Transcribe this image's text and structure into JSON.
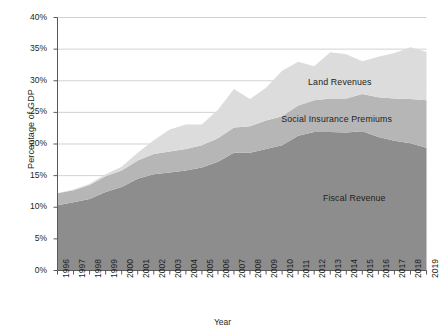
{
  "chart_data": {
    "type": "area",
    "stacked": true,
    "title": "",
    "subtitle": "",
    "xlabel": "Year",
    "ylabel": "Percentage of GDP",
    "grid": true,
    "legend_position": "inline-labels",
    "xlim": [
      1996,
      2019
    ],
    "ylim": [
      0,
      40
    ],
    "ytick_labels": [
      "0%",
      "5%",
      "10%",
      "15%",
      "20%",
      "25%",
      "30%",
      "35%",
      "40%"
    ],
    "ytick_values": [
      0,
      5,
      10,
      15,
      20,
      25,
      30,
      35,
      40
    ],
    "categories": [
      "1996",
      "1997",
      "1998",
      "1999",
      "2000",
      "2001",
      "2002",
      "2003",
      "2004",
      "2005",
      "2006",
      "2007",
      "2008",
      "2009",
      "2010",
      "2011",
      "2012",
      "2013",
      "2014",
      "2015",
      "2016",
      "2017",
      "2018",
      "2019"
    ],
    "series": [
      {
        "name": "Fiscal Revenue",
        "color": "#8d8d8d",
        "label_x": 2014.5,
        "label_y": 11.5,
        "values": [
          10.3,
          10.8,
          11.3,
          12.4,
          13.2,
          14.5,
          15.2,
          15.5,
          15.8,
          16.3,
          17.2,
          18.6,
          18.6,
          19.2,
          19.8,
          21.3,
          21.9,
          21.9,
          21.8,
          22.0,
          21.1,
          20.5,
          20.1,
          19.4
        ]
      },
      {
        "name": "Social Insurance Premiums",
        "color": "#b6b6b6",
        "label_x": 2013.4,
        "label_y": 24.0,
        "values": [
          1.9,
          1.9,
          2.2,
          2.5,
          2.6,
          2.9,
          3.2,
          3.3,
          3.4,
          3.5,
          3.7,
          4.0,
          4.2,
          4.5,
          4.6,
          4.8,
          5.0,
          5.3,
          5.4,
          5.9,
          6.3,
          6.7,
          7.0,
          7.5
        ]
      },
      {
        "name": "Land Revenues",
        "color": "#dcdcdc",
        "label_x": 2013.6,
        "label_y": 29.8,
        "values": [
          0.0,
          0.1,
          0.2,
          0.3,
          0.6,
          1.2,
          2.2,
          3.5,
          3.9,
          3.3,
          4.5,
          6.1,
          4.3,
          5.2,
          7.2,
          6.9,
          5.4,
          7.3,
          7.0,
          5.2,
          6.4,
          7.2,
          8.2,
          7.7
        ]
      }
    ],
    "totals": [
      12.2,
      12.8,
      13.7,
      15.2,
      16.4,
      18.6,
      20.6,
      22.3,
      23.1,
      23.1,
      25.4,
      28.7,
      27.1,
      28.9,
      31.6,
      33.0,
      32.3,
      34.5,
      34.2,
      33.1,
      33.8,
      34.4,
      35.3,
      34.6
    ]
  }
}
